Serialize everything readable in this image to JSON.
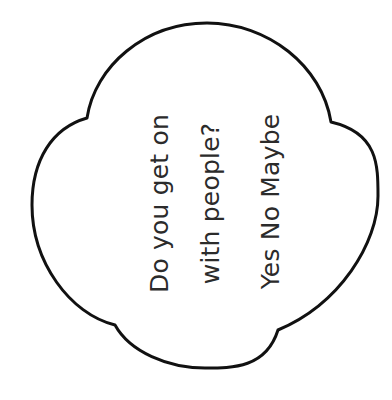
{
  "page": {
    "background_color": "#ffffff",
    "width": 392,
    "height": 400
  },
  "worksheet": {
    "shape_name": "quatrefoil-cloud-outline",
    "shape_stroke_color": "#111111",
    "shape_fill_color": "#ffffff",
    "shape_stroke_width": 3,
    "text_color": "#2b2b2b",
    "text_rotation_degrees": -90,
    "lines": [
      {
        "text": "Do you get on"
      },
      {
        "text": "with people?"
      },
      {
        "text": "Yes  No  Maybe"
      }
    ],
    "question": "Do you get on with people?",
    "answer_options": [
      "Yes",
      "No",
      "Maybe"
    ]
  }
}
